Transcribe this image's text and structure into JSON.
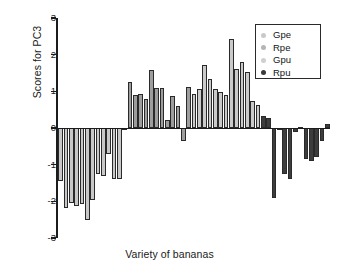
{
  "chart_data": {
    "type": "bar",
    "title": "",
    "xlabel": "Variety of bananas",
    "ylabel": "Scores for PC3",
    "ylim": [
      -3,
      3
    ],
    "yticks": [
      3,
      2,
      1,
      0,
      -1,
      -2,
      -3
    ],
    "ytick_labels": [
      "3",
      "2",
      "1",
      "0",
      "-1",
      "-2",
      "-3"
    ],
    "xtick_labels": [],
    "grid": false,
    "legend_position": "top-right",
    "legend": [
      {
        "label": "Gpe",
        "color": "#c9c9c9"
      },
      {
        "label": "Rpe",
        "color": "#b5b5b5"
      },
      {
        "label": "Gpu",
        "color": "#cfcfcf"
      },
      {
        "label": "Rpu",
        "color": "#3a3a3a"
      }
    ],
    "series": [
      {
        "name": "Gpe",
        "color": "#c8c8c8",
        "values": [
          -1.45,
          -2.18,
          -2.05,
          -2.12,
          -2.08,
          -2.5,
          -1.96,
          -1.25,
          -1.3,
          -0.7,
          -1.38,
          -1.38,
          -0.04
        ]
      },
      {
        "name": "Rpe",
        "color": "#9e9e9e",
        "values": [
          1.26,
          0.91,
          0.93,
          0.78,
          1.58,
          1.08,
          1.09,
          0.22,
          0.87,
          0.6,
          -0.35,
          1.11
        ]
      },
      {
        "name": "Gpu",
        "color": "#cacaca",
        "values": [
          0.92,
          1.06,
          1.72,
          1.34,
          1.07,
          0.97,
          0.9,
          2.42,
          1.6,
          1.8,
          1.52,
          0.74,
          0.64
        ]
      },
      {
        "name": "Rpu",
        "color": "#3d3d3d",
        "values": [
          0.32,
          0.26,
          -1.92,
          -0.02,
          -1.26,
          -1.4,
          -0.11,
          0.04,
          -0.85,
          -0.9,
          -0.78,
          -0.35,
          0.12
        ]
      }
    ]
  }
}
